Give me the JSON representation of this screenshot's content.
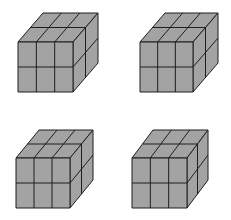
{
  "diagram": {
    "colors": {
      "face": "#a3a3a3",
      "line": "#1e1e1e",
      "background": "#ffffff"
    },
    "cubes": [
      {
        "id": "cube-1",
        "position": "top-left",
        "front": {
          "x": 18,
          "y": 42,
          "w": 55,
          "h": 50
        },
        "depth": {
          "dx": 25,
          "dy": -29
        },
        "grid": {
          "cols": 3,
          "rows": 2,
          "depth": 2
        }
      },
      {
        "id": "cube-2",
        "position": "top-right",
        "front": {
          "x": 140,
          "y": 42,
          "w": 53,
          "h": 50
        },
        "depth": {
          "dx": 25,
          "dy": -29
        },
        "grid": {
          "cols": 3,
          "rows": 2,
          "depth": 2
        }
      },
      {
        "id": "cube-3",
        "position": "bottom-left",
        "front": {
          "x": 16,
          "y": 158,
          "w": 54,
          "h": 50
        },
        "depth": {
          "dx": 23,
          "dy": -28
        },
        "grid": {
          "cols": 3,
          "rows": 2,
          "depth": 2
        }
      },
      {
        "id": "cube-4",
        "position": "bottom-right",
        "front": {
          "x": 132,
          "y": 158,
          "w": 55,
          "h": 50
        },
        "depth": {
          "dx": 21,
          "dy": -28
        },
        "grid": {
          "cols": 3,
          "rows": 2,
          "depth": 2
        }
      }
    ]
  }
}
